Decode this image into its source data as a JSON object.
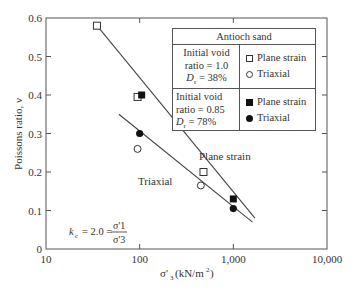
{
  "chart_data": {
    "type": "scatter",
    "title": "",
    "xlabel": "σ'3 (kN/m²)",
    "ylabel": "Poissons ratio, ν",
    "xscale": "log",
    "xlim": [
      10,
      10000
    ],
    "ylim": [
      0,
      0.6
    ],
    "x_ticks": [
      10,
      100,
      1000,
      10000
    ],
    "x_tick_labels": [
      "10",
      "100",
      "1,000",
      "10,000"
    ],
    "y_ticks": [
      0,
      0.1,
      0.2,
      0.3,
      0.4,
      0.5,
      0.6
    ],
    "y_tick_labels": [
      "0",
      "0.1",
      "0.2",
      "0.3",
      "0.4",
      "0.5",
      "0.6"
    ],
    "grid": false,
    "legend_position": "upper right",
    "series": [
      {
        "name": "Plane strain (e0 = 1.0, Dr = 38%)",
        "marker": "open-square",
        "x": [
          35,
          95,
          480
        ],
        "y": [
          0.58,
          0.395,
          0.2
        ]
      },
      {
        "name": "Triaxial (e0 = 1.0, Dr = 38%)",
        "marker": "open-circle",
        "x": [
          95,
          450
        ],
        "y": [
          0.26,
          0.165
        ]
      },
      {
        "name": "Plane strain (e0 = 0.85, Dr = 78%)",
        "marker": "filled-square",
        "x": [
          105,
          1000
        ],
        "y": [
          0.4,
          0.13
        ]
      },
      {
        "name": "Triaxial (e0 = 0.85, Dr = 78%)",
        "marker": "filled-circle",
        "x": [
          100,
          1000
        ],
        "y": [
          0.3,
          0.105
        ]
      }
    ],
    "trend_lines": [
      {
        "name": "Plane strain",
        "x": [
          35,
          1700
        ],
        "y": [
          0.58,
          0.08
        ]
      },
      {
        "name": "Triaxial",
        "x": [
          60,
          1600
        ],
        "y": [
          0.35,
          0.07
        ]
      }
    ],
    "annotations": [
      {
        "text": "Plane strain",
        "x": 480,
        "y": 0.24
      },
      {
        "text": "Triaxial",
        "x": 100,
        "y": 0.185
      },
      {
        "text": "kc = 2.0 = σ'1 / σ'3",
        "x": 20,
        "y": 0.08
      }
    ]
  },
  "legend": {
    "title": "Antioch sand",
    "group1": {
      "line1": "Initial void",
      "line2": "ratio = 1.0",
      "dr_label": "D",
      "dr_sub": "r",
      "dr_value": " = 38%",
      "item1": "Plane strain",
      "item2": "Triaxial"
    },
    "group2": {
      "line1": "Initial void",
      "line2": "ratio = 0.85",
      "dr_label": "D",
      "dr_sub": "r",
      "dr_value": " = 78%",
      "item1": "Plane strain",
      "item2": "Triaxial"
    }
  },
  "labels": {
    "plane_strain": "Plane strain",
    "triaxial": "Triaxial",
    "kc_left": "= 2.0 =",
    "kc_num": "σ'1",
    "kc_den": "σ'3"
  }
}
